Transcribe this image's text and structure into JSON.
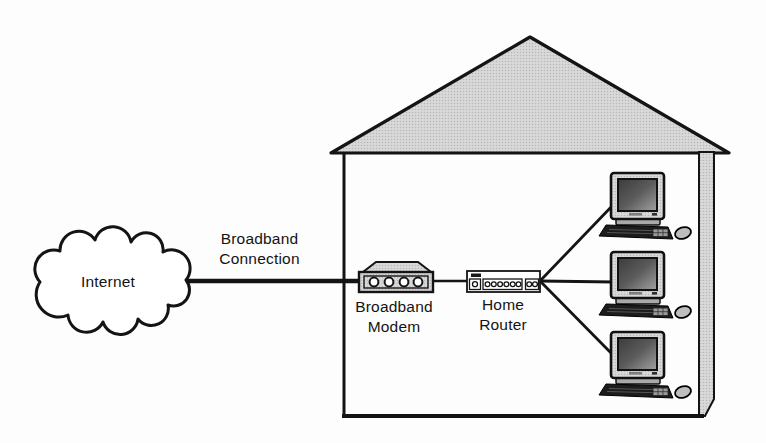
{
  "diagram": {
    "type": "network-topology",
    "labels": {
      "internet": "Internet",
      "broadband_connection": "Broadband\nConnection",
      "broadband_modem": "Broadband\nModem",
      "home_router": "Home\nRouter"
    },
    "icons": {
      "internet": "cloud-icon",
      "broadband_modem": "modem-box-with-4-ports-icon",
      "home_router": "router-box-with-ports-icon",
      "computer": "desktop-computer-monitor-keyboard-mouse-icon",
      "house": "house-outline-gray-roof-icon"
    },
    "nodes": [
      {
        "id": "internet",
        "label": "Internet",
        "inside_house": false
      },
      {
        "id": "broadband-modem",
        "label": "Broadband Modem",
        "inside_house": true
      },
      {
        "id": "home-router",
        "label": "Home Router",
        "inside_house": true
      },
      {
        "id": "computer-1",
        "label": "",
        "inside_house": true
      },
      {
        "id": "computer-2",
        "label": "",
        "inside_house": true
      },
      {
        "id": "computer-3",
        "label": "",
        "inside_house": true
      }
    ],
    "connections": [
      {
        "from": "internet",
        "to": "broadband-modem",
        "label": "Broadband Connection",
        "style": "thick"
      },
      {
        "from": "broadband-modem",
        "to": "home-router",
        "label": "",
        "style": "thin"
      },
      {
        "from": "home-router",
        "to": "computer-1",
        "label": "",
        "style": "thin"
      },
      {
        "from": "home-router",
        "to": "computer-2",
        "label": "",
        "style": "thin"
      },
      {
        "from": "home-router",
        "to": "computer-3",
        "label": "",
        "style": "thin"
      }
    ],
    "colors": {
      "background": "#fdfdfd",
      "line": "#141414",
      "roof_fill": "#d4d4d4",
      "wall_fill": "#d4d4d4",
      "modem_fill": "#d4d4d4",
      "router_fill": "#ffffff",
      "monitor_fill": "#c6c6c6",
      "screen_dark": "#3f3f3f",
      "screen_light": "#a0a0a0",
      "keyboard_fill": "#1c1c1c",
      "mouse_fill": "#bdbdbd",
      "cloud_fill": "#ffffff"
    }
  }
}
